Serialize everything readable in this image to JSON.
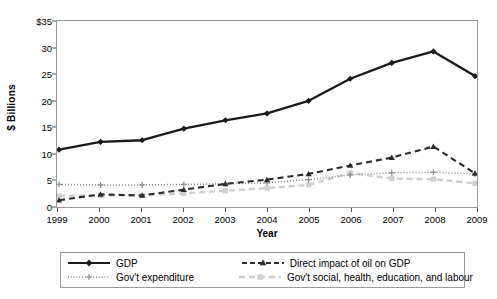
{
  "chart_data": {
    "type": "line",
    "title": "",
    "xlabel": "Year",
    "ylabel": "$ Billions",
    "x": [
      1999,
      2000,
      2001,
      2002,
      2003,
      2004,
      2005,
      2006,
      2007,
      2008,
      2009
    ],
    "xtick_labels": [
      "1999",
      "2000",
      "2001",
      "2002",
      "2003",
      "2004",
      "2005",
      "2006",
      "2007",
      "2008",
      "2009"
    ],
    "ytick_labels": [
      "0",
      "5",
      "10",
      "15",
      "20",
      "25",
      "30",
      "$35"
    ],
    "ytick_values": [
      0,
      5,
      10,
      15,
      20,
      25,
      30,
      35
    ],
    "ylim": [
      0,
      35
    ],
    "xlim": [
      1999,
      2009
    ],
    "grid": false,
    "legend_position": "below",
    "series": [
      {
        "name": "GDP",
        "values": [
          10.9,
          12.4,
          12.7,
          14.9,
          16.5,
          17.8,
          20.2,
          24.4,
          27.4,
          29.6,
          24.9
        ],
        "color": "#1a1a1a",
        "style": "solid",
        "marker": "diamond"
      },
      {
        "name": "Direct impact of oil on GDP",
        "values": [
          1.3,
          2.4,
          2.2,
          3.3,
          4.4,
          5.2,
          6.3,
          7.9,
          9.4,
          11.5,
          6.4
        ],
        "color": "#2b2b2b",
        "style": "dashed",
        "marker": "triangle"
      },
      {
        "name": "Gov't expenditure",
        "values": [
          4.3,
          4.2,
          4.2,
          4.3,
          4.4,
          4.6,
          5.2,
          6.1,
          6.5,
          6.6,
          6.3
        ],
        "color": "#8c8c8c",
        "style": "dotted",
        "marker": "plus"
      },
      {
        "name": "Gov't social, health, education, and labour",
        "values": [
          2.1,
          2.2,
          2.2,
          2.6,
          3.1,
          3.6,
          4.2,
          6.5,
          5.4,
          5.3,
          4.5
        ],
        "color": "#cfcfcf",
        "style": "dashed",
        "marker": "square"
      }
    ]
  },
  "legend": {
    "items": [
      {
        "label": "GDP"
      },
      {
        "label": "Direct impact of oil on GDP"
      },
      {
        "label": "Gov't expenditure"
      },
      {
        "label": "Gov't social, health, education, and labour"
      }
    ]
  },
  "colors": {
    "gdp": "#1a1a1a",
    "oil": "#2b2b2b",
    "expenditure": "#8c8c8c",
    "social": "#cfcfcf",
    "axis": "#9a9a9a",
    "background": "#ffffff"
  }
}
